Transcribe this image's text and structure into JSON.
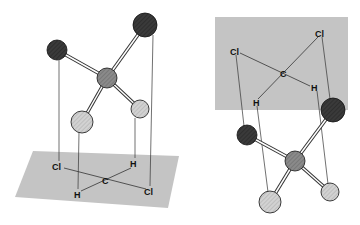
{
  "figure": {
    "left_panel": {
      "description": "Dichloromethane 3D ball-and-stick model projected down onto a plane",
      "labels": {
        "cl1": "Cl",
        "h1": "H",
        "c": "C",
        "h2": "H",
        "cl2": "Cl"
      }
    },
    "right_panel": {
      "description": "Dichloromethane 3D ball-and-stick model projected up onto a plane",
      "labels": {
        "cl1": "Cl",
        "cl2": "Cl",
        "c": "C",
        "h1": "H",
        "h2": "H"
      }
    },
    "colors": {
      "plane": "#c4c4c4",
      "chlorine": "#3a3a3a",
      "carbon": "#8a8a8a",
      "hydrogen": "#cfcfcf",
      "line": "#333333"
    }
  }
}
